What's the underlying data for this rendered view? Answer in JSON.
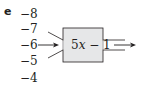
{
  "part_label": "e",
  "inputs": [
    "−8",
    "−7",
    "−6",
    "−5",
    "−4"
  ],
  "active_input": "−6",
  "machine": {
    "rule": "5x − 1",
    "rule_coef": "5",
    "rule_var": "x",
    "rule_rest": " − 1",
    "fill_color": "#e6e7e8",
    "stroke_color": "#231f20"
  }
}
